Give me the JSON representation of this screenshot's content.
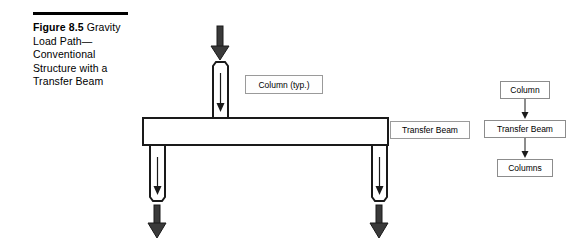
{
  "figure": {
    "caption_label": "Figure 8.5",
    "caption_body": " Gravity Load Path—Conventional Structure with a Transfer Beam",
    "rule_color": "#000000"
  },
  "diagram": {
    "stroke_color": "#1a1a1a",
    "fill_color": "#ffffff",
    "arrow_fill": "#3a3a3a",
    "labels": {
      "column_typ": "Column (typ.)",
      "transfer_beam": "Transfer Beam"
    },
    "elements": [
      {
        "name": "top-column",
        "type": "column",
        "x": 213,
        "y": 62,
        "width": 15,
        "height": 56
      },
      {
        "name": "transfer-beam",
        "type": "beam",
        "x": 143,
        "y": 118,
        "width": 245,
        "height": 27
      },
      {
        "name": "lower-left-column",
        "type": "column",
        "x": 150,
        "y": 145,
        "width": 15,
        "height": 56
      },
      {
        "name": "lower-right-column",
        "type": "column",
        "x": 372,
        "y": 145,
        "width": 15,
        "height": 56
      }
    ],
    "load_arrows": [
      {
        "name": "top-load-arrow",
        "direction": "down",
        "x": 220,
        "y_start": 26,
        "y_end": 60
      },
      {
        "name": "left-reaction-arrow",
        "direction": "down",
        "x": 157,
        "y_start": 205,
        "y_end": 238
      },
      {
        "name": "right-reaction-arrow",
        "direction": "down",
        "x": 379,
        "y_start": 205,
        "y_end": 238
      }
    ],
    "internal_arrows": [
      {
        "name": "top-column-force-arrow",
        "direction": "down",
        "x": 220,
        "y_start": 73,
        "y_end": 110
      },
      {
        "name": "left-column-force-arrow",
        "direction": "down",
        "x": 157,
        "y_start": 157,
        "y_end": 194
      },
      {
        "name": "right-column-force-arrow",
        "direction": "down",
        "x": 379,
        "y_start": 157,
        "y_end": 194
      }
    ]
  },
  "flowchart": {
    "orientation": "vertical",
    "border_color": "#8c8c8c",
    "nodes": [
      {
        "name": "flow-node-column",
        "label": "Column"
      },
      {
        "name": "flow-node-transfer-beam",
        "label": "Transfer Beam"
      },
      {
        "name": "flow-node-columns",
        "label": "Columns"
      }
    ],
    "connectors": [
      {
        "from": "Column",
        "to": "Transfer Beam",
        "direction": "down"
      },
      {
        "from": "Transfer Beam",
        "to": "Columns",
        "direction": "down"
      }
    ]
  }
}
